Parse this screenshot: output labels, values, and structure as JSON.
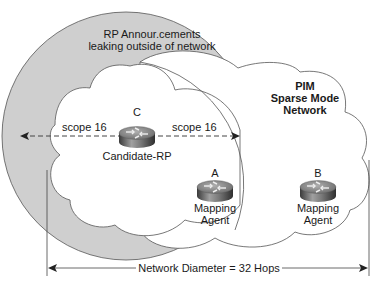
{
  "diagram": {
    "annotation": {
      "line1": "RP Annour.cements",
      "line2": "leaking outside of network"
    },
    "network": {
      "line1": "PIM",
      "line2": "Sparse Mode",
      "line3": "Network"
    },
    "routers": [
      {
        "letter": "C",
        "label": "Candidate-RP"
      },
      {
        "letter": "A",
        "label_line1": "Mapping",
        "label_line2": "Agent"
      },
      {
        "letter": "B",
        "label_line1": "Mapping",
        "label_line2": "Agent"
      }
    ],
    "scope_left": "scope 16",
    "scope_right": "scope 16",
    "diameter": "Network Diameter = 32 Hops"
  },
  "colors": {
    "leak_fill": "#cfcfcf",
    "line": "#333333",
    "router_body": "#6e6e6e",
    "router_top": "#8a8a8a"
  }
}
